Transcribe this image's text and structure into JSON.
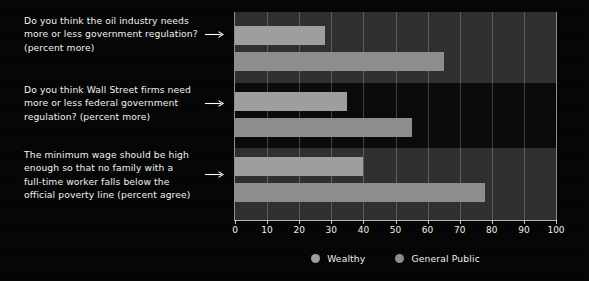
{
  "chart_data": {
    "type": "bar",
    "orientation": "horizontal",
    "title": "",
    "subtitle": "",
    "xlabel": "",
    "ylabel": "",
    "xlim": [
      0,
      100
    ],
    "xticks": [
      0,
      10,
      20,
      30,
      40,
      50,
      60,
      70,
      80,
      90,
      100
    ],
    "xticklabels": [
      "0",
      "10",
      "20",
      "30",
      "40",
      "50",
      "60",
      "70",
      "80",
      "90",
      "100"
    ],
    "grid": true,
    "grid_axis": "x",
    "legend_position": "bottom-center",
    "categories": [
      "Do you think the oil industry needs\nmore or less government regulation?\n(percent more)",
      "Do you think Wall Street firms need\nmore or less federal government\nregulation? (percent more)",
      "The minimum wage should be high\nenough so that no family with a\nfull-time worker falls below the\nofficial poverty line (percent  agree)"
    ],
    "series": [
      {
        "name": "Wealthy",
        "color": "#9e9e9e",
        "values": [
          28,
          35,
          40
        ]
      },
      {
        "name": "General Public",
        "color": "#8d8d8d",
        "values": [
          65,
          55,
          78
        ]
      }
    ]
  },
  "legend": {
    "items": [
      {
        "label": "Wealthy",
        "color": "#9e9e9e",
        "marker": "circle-marker"
      },
      {
        "label": "General Public",
        "color": "#8d8d8d",
        "marker": "circle-marker"
      }
    ]
  },
  "colors": {
    "background": "#050505",
    "band_light": "#2f2f2f",
    "band_dark": "#0a0a0a",
    "gridline": "rgba(255,255,255,0.22)",
    "text": "#f2f2f2",
    "axis": "rgba(255,255,255,0.7)"
  },
  "labels": {
    "rows": [
      {
        "text": "Do you think the oil industry needs\nmore or less government regulation?\n(percent more)",
        "arrow": "arrow-right-icon"
      },
      {
        "text": "Do you think Wall Street firms need\nmore or less federal government\nregulation? (percent more)",
        "arrow": "arrow-right-icon"
      },
      {
        "text": "The minimum wage should be high\nenough so that no family with a\nfull-time worker falls below the\nofficial poverty line (percent  agree)",
        "arrow": "arrow-right-icon"
      }
    ]
  }
}
